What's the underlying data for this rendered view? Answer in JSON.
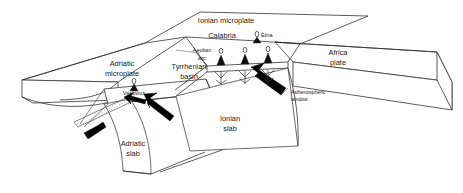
{
  "figure": {
    "type": "geological-block-diagram",
    "background_color": "#ffffff",
    "line_color": "#333333",
    "arrow_color": "#000000",
    "width": 463,
    "height": 193
  },
  "labels": {
    "ionian_microplate": "Ionian microplate",
    "calabria": "Calabria",
    "etna": "Etna",
    "africa_plate_line1": "Africa",
    "africa_plate_line2": "plate",
    "adriatic_microplate_line1": "Adriatic",
    "adriatic_microplate_line2": "microplate",
    "vesuvius": "Vesuvius",
    "aeolian_arc_line1": "Aeolian",
    "aeolian_arc_line2": "arc",
    "tyrrhenian_basin_line1": "Tyrrhenian",
    "tyrrhenian_basin_line2": "basin",
    "asthenospheric_window_line1": "Asthenospheric",
    "asthenospheric_window_line2": "window",
    "ionian_slab_line1": "Ionian",
    "ionian_slab_line2": "slab",
    "adriatic_slab_line1": "Adriatic",
    "adriatic_slab_line2": "slab"
  },
  "features": {
    "volcanoes": [
      {
        "name": "Vesuvius",
        "x": 134,
        "y": 89
      },
      {
        "name": "Aeolian arc vent 1",
        "x": 221,
        "y": 58
      },
      {
        "name": "Aeolian arc vent 2",
        "x": 245,
        "y": 57
      },
      {
        "name": "Aeolian arc vent 3",
        "x": 268,
        "y": 56
      },
      {
        "name": "Etna",
        "x": 258,
        "y": 41
      }
    ],
    "arrows": [
      {
        "name": "convergence-arrow-upper-left",
        "direction": "west"
      },
      {
        "name": "convergence-arrow-lower-right",
        "direction": "northwest"
      },
      {
        "name": "convergence-arrow-far-left",
        "direction": "southwest"
      },
      {
        "name": "asthenospheric-window-arrow",
        "direction": "northwest"
      }
    ],
    "slabs": [
      {
        "name": "Ionian slab"
      },
      {
        "name": "Adriatic slab"
      }
    ],
    "plates": [
      {
        "name": "Adriatic microplate"
      },
      {
        "name": "Ionian microplate"
      },
      {
        "name": "Africa plate"
      },
      {
        "name": "Tyrrhenian basin"
      }
    ]
  }
}
